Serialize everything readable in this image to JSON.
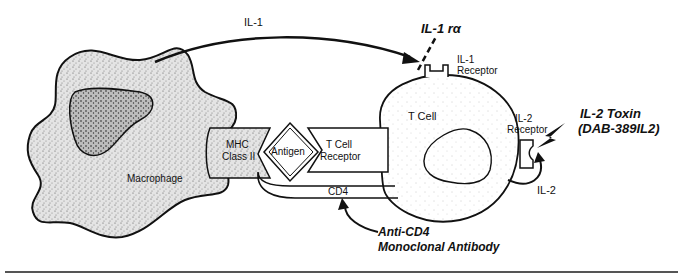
{
  "diagram": {
    "type": "immunology-schematic",
    "cells": {
      "macrophage": "Macrophage",
      "t_cell": "T Cell"
    },
    "molecules": {
      "mhc_line1": "MHC",
      "mhc_line2": "Class II",
      "antigen": "Antigen",
      "tcr_line1": "T Cell",
      "tcr_line2": "Receptor",
      "cd4": "CD4",
      "il1_receptor_line1": "IL-1",
      "il1_receptor_line2": "Receptor",
      "il2_receptor_line1": "IL-2",
      "il2_receptor_line2": "Receptor"
    },
    "signals": {
      "il1": "IL-1",
      "il2": "IL-2"
    },
    "inhibitors": {
      "il1ra": "IL-1 rα",
      "il2_toxin_line1": "IL-2 Toxin",
      "il2_toxin_line2": "(DAB-389IL2)",
      "anti_cd4_line1": "Anti-CD4",
      "anti_cd4_line2": "Monoclonal Antibody"
    }
  }
}
